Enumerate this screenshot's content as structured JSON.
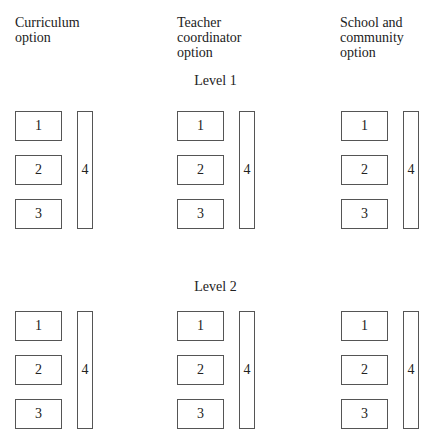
{
  "columns": [
    {
      "label": "Curriculum\noption"
    },
    {
      "label": "Teacher\ncoordinator\noption"
    },
    {
      "label": "School and\ncommunity\noption"
    }
  ],
  "levels": [
    {
      "label": "Level 1"
    },
    {
      "label": "Level 2"
    }
  ],
  "boxes": {
    "b1": "1",
    "b2": "2",
    "b3": "3",
    "b4": "4"
  }
}
